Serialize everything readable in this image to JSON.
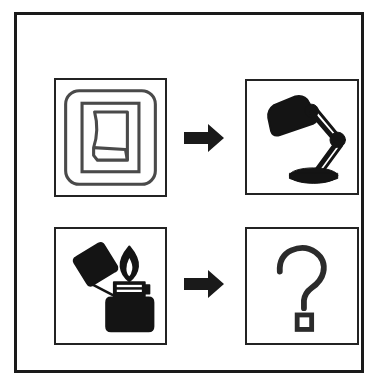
{
  "figure": {
    "title": "Switch turns on lamp; lighter outcome unknown",
    "background_color": "#ffffff",
    "line_color": "#232323",
    "fill_color": "#1a1a1a",
    "outer_frame": {
      "label": "Outer border frame",
      "border_color": "#1a1a1a",
      "border_width": "3px"
    }
  },
  "rows": [
    {
      "id": "row-known",
      "cause_label": "Light switch",
      "arrow_label": "leads to",
      "effect_label": "Desk lamp turned on"
    },
    {
      "id": "row-unknown",
      "cause_label": "Lit cigarette lighter",
      "arrow_label": "leads to",
      "effect_label": "Unknown outcome"
    }
  ],
  "panels": {
    "switch": {
      "name": "Rocker light switch",
      "caption": "",
      "icon": "light-switch-icon",
      "style": "outline"
    },
    "lamp": {
      "name": "Architect desk lamp",
      "caption": "",
      "icon": "desk-lamp-icon",
      "style": "silhouette"
    },
    "lighter": {
      "name": "Open flame lighter",
      "caption": "",
      "icon": "lighter-flame-icon",
      "style": "silhouette"
    },
    "unknown": {
      "name": "Question mark",
      "caption": "",
      "icon": "question-mark-icon",
      "glyph": "?",
      "style": "outline"
    }
  },
  "arrows": {
    "top": {
      "name": "Right arrow",
      "direction": "right",
      "color": "#1a1a1a"
    },
    "bottom": {
      "name": "Right arrow",
      "direction": "right",
      "color": "#1a1a1a"
    }
  }
}
